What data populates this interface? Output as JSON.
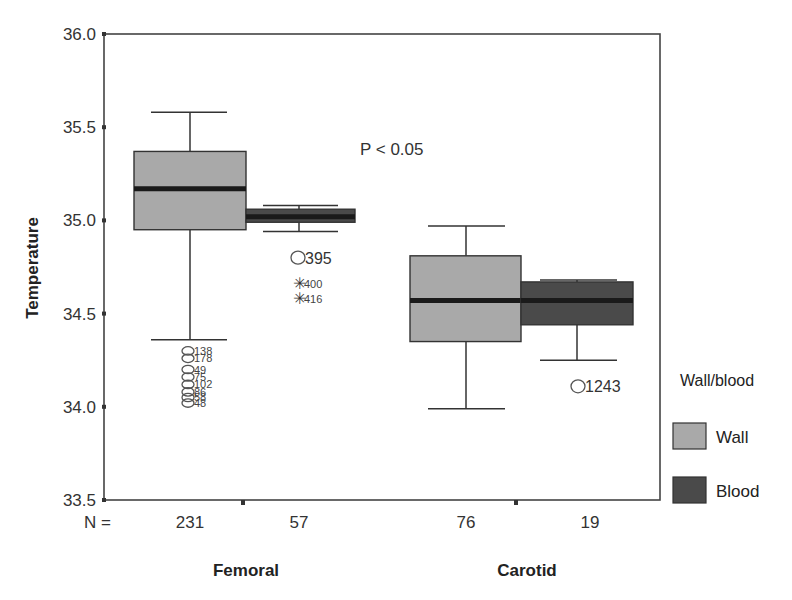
{
  "chart_data": {
    "type": "boxplot",
    "title": "",
    "xlabel": "",
    "ylabel": "Temperature",
    "ylim": [
      33.5,
      36.0
    ],
    "yticks": [
      "33.5",
      "34.0",
      "34.5",
      "35.0",
      "35.5",
      "36.0"
    ],
    "grid": false,
    "categories": [
      "Femoral",
      "Carotid"
    ],
    "legend": {
      "title": "Wall/blood",
      "position": "right",
      "entries": [
        {
          "label": "Wall",
          "color": "#a9a9a9"
        },
        {
          "label": "Blood",
          "color": "#4a4a4a"
        }
      ]
    },
    "n_label": "N =",
    "annotation": "P < 0.05",
    "series": [
      {
        "name": "Wall",
        "color": "#a9a9a9",
        "boxes": [
          {
            "category": "Femoral",
            "n": 231,
            "whisker_low": 34.36,
            "q1": 34.95,
            "median": 35.17,
            "q3": 35.37,
            "whisker_high": 35.58,
            "outliers": [
              {
                "value": 34.3,
                "label": "138",
                "marker": "circle"
              },
              {
                "value": 34.26,
                "label": "178",
                "marker": "circle"
              },
              {
                "value": 34.2,
                "label": "49",
                "marker": "circle"
              },
              {
                "value": 34.16,
                "label": "75",
                "marker": "circle"
              },
              {
                "value": 34.12,
                "label": "102",
                "marker": "circle"
              },
              {
                "value": 34.08,
                "label": "86",
                "marker": "circle"
              },
              {
                "value": 34.05,
                "label": "58",
                "marker": "circle"
              },
              {
                "value": 34.02,
                "label": "48",
                "marker": "circle"
              }
            ]
          },
          {
            "category": "Carotid",
            "n": 76,
            "whisker_low": 33.99,
            "q1": 34.35,
            "median": 34.57,
            "q3": 34.81,
            "whisker_high": 34.97,
            "outliers": []
          }
        ]
      },
      {
        "name": "Blood",
        "color": "#4a4a4a",
        "boxes": [
          {
            "category": "Femoral",
            "n": 57,
            "whisker_low": 34.94,
            "q1": 34.99,
            "median": 35.02,
            "q3": 35.06,
            "whisker_high": 35.08,
            "outliers": [
              {
                "value": 34.8,
                "label": "395",
                "marker": "circle"
              },
              {
                "value": 34.66,
                "label": "400",
                "marker": "star"
              },
              {
                "value": 34.58,
                "label": "416",
                "marker": "star"
              }
            ]
          },
          {
            "category": "Carotid",
            "n": 19,
            "whisker_low": 34.25,
            "q1": 34.44,
            "median": 34.57,
            "q3": 34.67,
            "whisker_high": 34.68,
            "outliers": [
              {
                "value": 34.11,
                "label": "1243",
                "marker": "circle"
              }
            ]
          }
        ]
      }
    ]
  },
  "labels": {
    "y_axis_title": "Temperature",
    "n_prefix": "N =",
    "annotation": "P < 0.05",
    "groups": [
      "Femoral",
      "Carotid"
    ],
    "n_values": [
      "231",
      "57",
      "76",
      "19"
    ],
    "legend_title": "Wall/blood",
    "legend_wall": "Wall",
    "legend_blood": "Blood"
  }
}
